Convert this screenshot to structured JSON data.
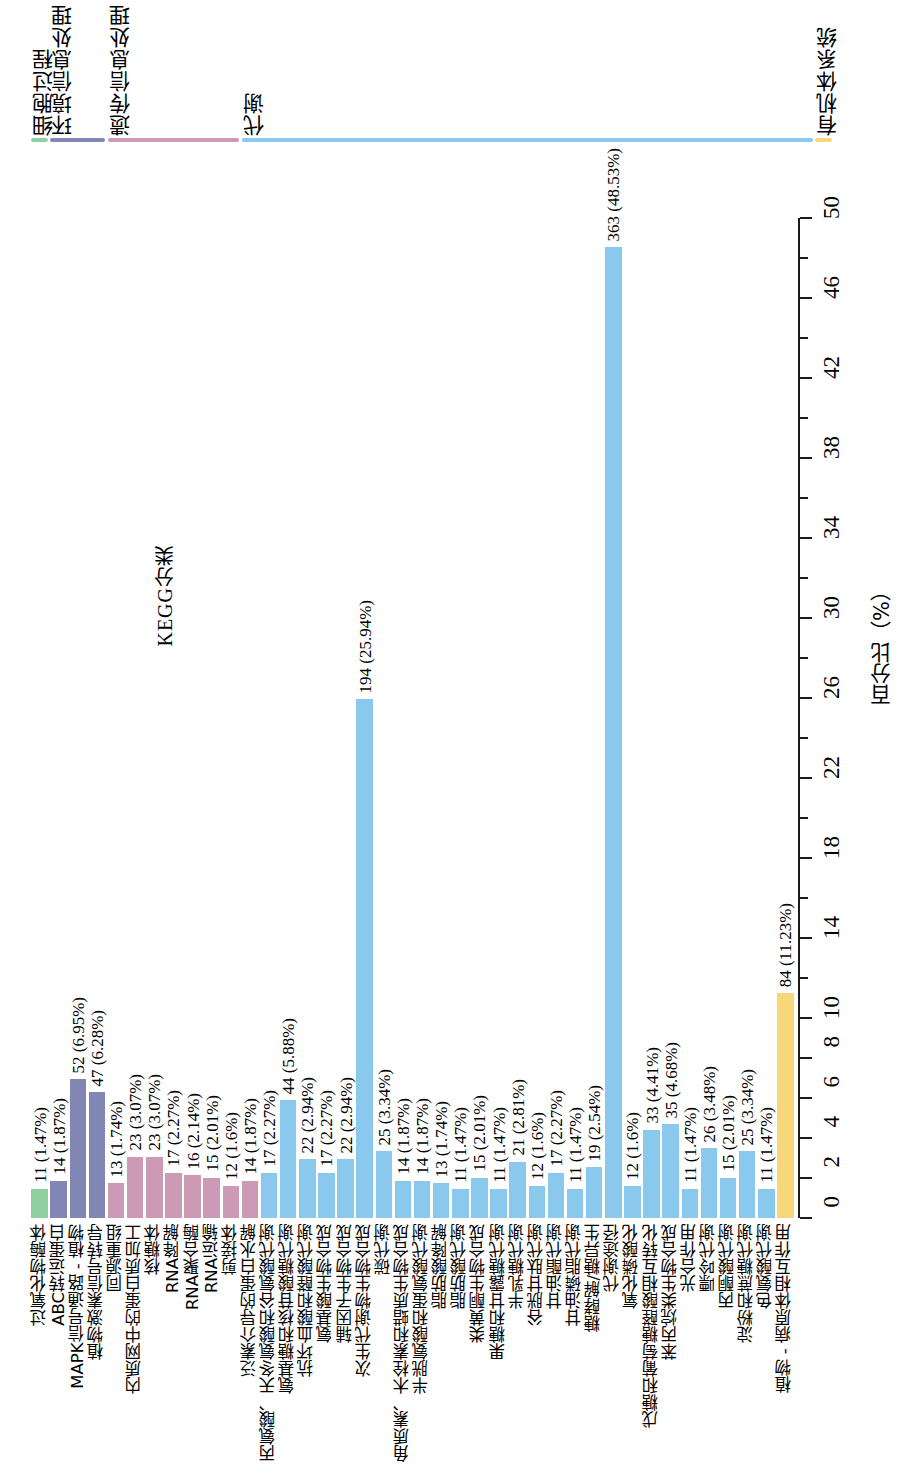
{
  "title": "KEGG分类",
  "axis": {
    "x_title": "百分比（%）",
    "ticks": [
      0,
      2,
      4,
      6,
      8,
      10,
      14,
      18,
      22,
      26,
      30,
      34,
      38,
      42,
      46,
      50
    ],
    "tick_labels": [
      "0",
      "2",
      "4",
      "6",
      "8",
      "10",
      "14",
      "18",
      "22",
      "26",
      "30",
      "34",
      "38",
      "42",
      "46",
      "50"
    ],
    "min": 0,
    "max": 50
  },
  "groups": [
    {
      "name": "细胞过程",
      "color": "#8fd0a0",
      "start_index": 0,
      "end_index": 0
    },
    {
      "name": "环境信息处理",
      "color": "#8286b5",
      "start_index": 1,
      "end_index": 3
    },
    {
      "name": "遗传信息处理",
      "color": "#cc9ab5",
      "start_index": 4,
      "end_index": 10
    },
    {
      "name": "代谢",
      "color": "#8ac8ee",
      "start_index": 11,
      "end_index": 40
    },
    {
      "name": "有机体系统",
      "color": "#f7d77a",
      "start_index": 41,
      "end_index": 41
    }
  ],
  "chart_data": {
    "type": "bar",
    "title": "KEGG分类",
    "xlabel": "百分比（%）",
    "ylabel": "",
    "xlim": [
      0,
      50
    ],
    "grid": false,
    "legend_position": "top",
    "orientation": "vertical",
    "categories": [
      "过氧化物酶体",
      "ABC转运蛋白",
      "MAPK信号通路 - 植物",
      "植物激素信号转导",
      "同源重组",
      "内质网中的蛋白质加工",
      "核糖体",
      "RNA降解",
      "RNA聚合酶",
      "RNA运输",
      "剪接体",
      "泛素介导的蛋白水解",
      "丙氨酸、天冬氨酸和谷氨酸代谢",
      "氨基糖和核苷酸糖代谢",
      "抗坏血酸和醛酸代谢",
      "氨基酸生物合成",
      "辅因子生物合成",
      "次生代谢物生物合成",
      "碳代谢",
      "角质素、木栓素和蜡质生物合成",
      "半胱氨酸和蛋氨酸代谢",
      "脂肪酸降解",
      "脂肪酸代谢",
      "类黄酮生物合成",
      "果糖和甘露糖代谢",
      "半乳糖代谢",
      "谷胱甘肽代谢",
      "甘油酯代谢",
      "甘油磷脂代谢",
      "糖酵解/糖异生",
      "代谢途径",
      "氧化磷酸化",
      "戊糖和葡萄糖醛酸相互转化",
      "苯丙烷类生物合成",
      "光合作用",
      "嘌呤代谢",
      "丙酮酸代谢",
      "淀粉和蔗糖代谢",
      "色氨酸代谢",
      "植物 - 病原体相互作用"
    ],
    "values": [
      11,
      14,
      52,
      47,
      13,
      23,
      23,
      17,
      16,
      15,
      12,
      14,
      17,
      44,
      22,
      17,
      22,
      194,
      25,
      14,
      14,
      13,
      11,
      15,
      11,
      21,
      12,
      17,
      11,
      19,
      363,
      12,
      33,
      35,
      11,
      26,
      15,
      25,
      11,
      84
    ],
    "percents": [
      1.47,
      1.87,
      6.95,
      6.28,
      1.74,
      3.07,
      3.07,
      2.27,
      2.14,
      2.01,
      1.6,
      1.87,
      2.27,
      5.88,
      2.94,
      2.27,
      2.94,
      25.94,
      3.34,
      1.87,
      1.87,
      1.74,
      1.47,
      2.01,
      1.47,
      2.81,
      1.6,
      2.27,
      1.47,
      2.54,
      48.53,
      1.6,
      4.41,
      4.68,
      1.47,
      3.48,
      2.01,
      3.34,
      1.47,
      11.23
    ]
  },
  "bars": [
    {
      "label": "过氧化物酶体",
      "count": 11,
      "percent": 1.47,
      "text": "11 (1.47%)",
      "group": 0,
      "color": "#8fd0a0",
      "show_label": true
    },
    {
      "label": "ABC转运蛋白",
      "count": 14,
      "percent": 1.87,
      "text": "14 (1.87%)",
      "group": 1,
      "color": "#8286b5",
      "show_label": true
    },
    {
      "label": "MAPK信号通路 - 植物",
      "count": 52,
      "percent": 6.95,
      "text": "52 (6.95%)",
      "group": 1,
      "color": "#8286b5",
      "show_label": true
    },
    {
      "label": "植物激素信号转导",
      "count": 47,
      "percent": 6.28,
      "text": "47 (6.28%)",
      "group": 1,
      "color": "#8286b5",
      "show_label": true
    },
    {
      "label": "同源重组",
      "count": 13,
      "percent": 1.74,
      "text": "13 (1.74%)",
      "group": 2,
      "color": "#cc9ab5",
      "show_label": true
    },
    {
      "label": "内质网中的蛋白质加工",
      "count": 23,
      "percent": 3.07,
      "text": "23 (3.07%)",
      "group": 2,
      "color": "#cc9ab5",
      "show_label": true
    },
    {
      "label": "核糖体",
      "count": 23,
      "percent": 3.07,
      "text": "23 (3.07%)",
      "group": 2,
      "color": "#cc9ab5",
      "show_label": true
    },
    {
      "label": "RNA降解",
      "count": 17,
      "percent": 2.27,
      "text": "17 (2.27%)",
      "group": 2,
      "color": "#cc9ab5",
      "show_label": true
    },
    {
      "label": "RNA聚合酶",
      "count": 16,
      "percent": 2.14,
      "text": "16 (2.14%)",
      "group": 2,
      "color": "#cc9ab5",
      "show_label": true
    },
    {
      "label": "RNA运输",
      "count": 15,
      "percent": 2.01,
      "text": "15 (2.01%)",
      "group": 2,
      "color": "#cc9ab5",
      "show_label": true
    },
    {
      "label": "剪接体",
      "count": 12,
      "percent": 1.6,
      "text": "12 (1.6%)",
      "group": 2,
      "color": "#cc9ab5",
      "show_label": true
    },
    {
      "label": "泛素介导的蛋白水解",
      "count": 14,
      "percent": 1.87,
      "text": "14 (1.87%)",
      "group": 2,
      "color": "#cc9ab5",
      "show_label": true
    },
    {
      "label": "丙氨酸、天冬氨酸和谷氨酸代谢",
      "count": 17,
      "percent": 2.27,
      "text": "17 (2.27%)",
      "group": 3,
      "color": "#8ac8ee",
      "show_label": true
    },
    {
      "label": "氨基糖和核苷酸糖代谢",
      "count": 44,
      "percent": 5.88,
      "text": "44 (5.88%)",
      "group": 3,
      "color": "#8ac8ee",
      "show_label": true
    },
    {
      "label": "抗坏血酸和醛酸代谢",
      "count": 22,
      "percent": 2.94,
      "text": "22 (2.94%)",
      "group": 3,
      "color": "#8ac8ee",
      "show_label": true
    },
    {
      "label": "氨基酸生物合成",
      "count": 17,
      "percent": 2.27,
      "text": "17 (2.27%)",
      "group": 3,
      "color": "#8ac8ee",
      "show_label": true
    },
    {
      "label": "辅因子生物合成",
      "count": 22,
      "percent": 2.94,
      "text": "22 (2.94%)",
      "group": 3,
      "color": "#8ac8ee",
      "show_label": true
    },
    {
      "label": "次生代谢物生物合成",
      "count": 194,
      "percent": 25.94,
      "text": "194 (25.94%)",
      "group": 3,
      "color": "#8ac8ee",
      "show_label": true
    },
    {
      "label": "碳代谢",
      "count": 25,
      "percent": 3.34,
      "text": "25 (3.34%)",
      "group": 3,
      "color": "#8ac8ee",
      "show_label": true
    },
    {
      "label": "角质素、木栓素和蜡质生物合成",
      "count": 14,
      "percent": 1.87,
      "text": "14 (1.87%)",
      "group": 3,
      "color": "#8ac8ee",
      "show_label": true
    },
    {
      "label": "半胱氨酸和蛋氨酸代谢",
      "count": 14,
      "percent": 1.87,
      "text": "14 (1.87%)",
      "group": 3,
      "color": "#8ac8ee",
      "show_label": true
    },
    {
      "label": "脂肪酸降解",
      "count": 13,
      "percent": 1.74,
      "text": "13 (1.74%)",
      "group": 3,
      "color": "#8ac8ee",
      "show_label": true
    },
    {
      "label": "脂肪酸代谢",
      "count": 11,
      "percent": 1.47,
      "text": "11 (1.47%)",
      "group": 3,
      "color": "#8ac8ee",
      "show_label": true
    },
    {
      "label": "类黄酮生物合成",
      "count": 15,
      "percent": 2.01,
      "text": "15 (2.01%)",
      "group": 3,
      "color": "#8ac8ee",
      "show_label": true
    },
    {
      "label": "果糖和甘露糖代谢",
      "count": 11,
      "percent": 1.47,
      "text": "11 (1.47%)",
      "group": 3,
      "color": "#8ac8ee",
      "show_label": true
    },
    {
      "label": "半乳糖代谢",
      "count": 21,
      "percent": 2.81,
      "text": "21 (2.81%)",
      "group": 3,
      "color": "#8ac8ee",
      "show_label": true
    },
    {
      "label": "谷胱甘肽代谢",
      "count": 12,
      "percent": 1.6,
      "text": "12 (1.6%)",
      "group": 3,
      "color": "#8ac8ee",
      "show_label": true
    },
    {
      "label": "甘油酯代谢",
      "count": 17,
      "percent": 2.27,
      "text": "17 (2.27%)",
      "group": 3,
      "color": "#8ac8ee",
      "show_label": true
    },
    {
      "label": "甘油磷脂代谢",
      "count": 11,
      "percent": 1.47,
      "text": "11 (1.47%)",
      "group": 3,
      "color": "#8ac8ee",
      "show_label": true
    },
    {
      "label": "糖酵解/糖异生",
      "count": 19,
      "percent": 2.54,
      "text": "19 (2.54%)",
      "group": 3,
      "color": "#8ac8ee",
      "show_label": true
    },
    {
      "label": "代谢途径",
      "count": 363,
      "percent": 48.53,
      "text": "363 (48.53%)",
      "group": 3,
      "color": "#8ac8ee",
      "show_label": true
    },
    {
      "label": "氧化磷酸化",
      "count": 12,
      "percent": 1.6,
      "text": "12 (1.6%)",
      "group": 3,
      "color": "#8ac8ee",
      "show_label": true
    },
    {
      "label": "戊糖和葡萄糖醛酸相互转化",
      "count": 33,
      "percent": 4.41,
      "text": "33 (4.41%)",
      "group": 3,
      "color": "#8ac8ee",
      "show_label": true
    },
    {
      "label": "苯丙烷类生物合成",
      "count": 35,
      "percent": 4.68,
      "text": "35 (4.68%)",
      "group": 3,
      "color": "#8ac8ee",
      "show_label": true
    },
    {
      "label": "光合作用",
      "count": 11,
      "percent": 1.47,
      "text": "11 (1.47%)",
      "group": 3,
      "color": "#8ac8ee",
      "show_label": true
    },
    {
      "label": "嘌呤代谢",
      "count": 26,
      "percent": 3.48,
      "text": "26 (3.48%)",
      "group": 3,
      "color": "#8ac8ee",
      "show_label": true
    },
    {
      "label": "丙酮酸代谢",
      "count": 15,
      "percent": 2.01,
      "text": "15 (2.01%)",
      "group": 3,
      "color": "#8ac8ee",
      "show_label": true
    },
    {
      "label": "淀粉和蔗糖代谢",
      "count": 25,
      "percent": 3.34,
      "text": "25 (3.34%)",
      "group": 3,
      "color": "#8ac8ee",
      "show_label": true
    },
    {
      "label": "色氨酸代谢",
      "count": 11,
      "percent": 1.47,
      "text": "11 (1.47%)",
      "group": 3,
      "color": "#8ac8ee",
      "show_label": true
    },
    {
      "label": "植物 - 病原体相互作用",
      "count": 84,
      "percent": 11.23,
      "text": "84 (11.23%)",
      "group": 4,
      "color": "#f7d77a",
      "show_label": true
    }
  ]
}
